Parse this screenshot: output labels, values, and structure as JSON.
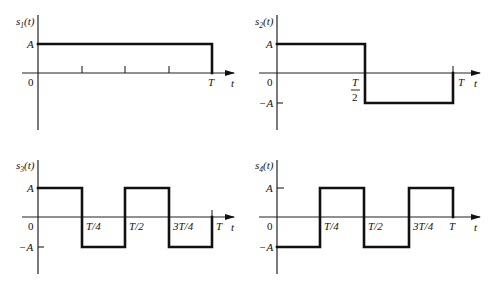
{
  "figure": {
    "axis_variable": "t",
    "zero_label": "0",
    "amplitude_label": "A",
    "neg_amplitude_label": "−A"
  },
  "panels": [
    {
      "id": "s1",
      "ylabel_main": "s",
      "ylabel_sub": "1",
      "ylabel_arg": "(t)",
      "y_ticks": [
        "A",
        "0"
      ],
      "x_tick_labels": [
        "T"
      ],
      "unlabeled_ticks": [
        "T/4",
        "T/2",
        "3T/4"
      ],
      "segments": [
        {
          "from": "0",
          "to": "T",
          "level": "A"
        }
      ]
    },
    {
      "id": "s2",
      "ylabel_main": "s",
      "ylabel_sub": "2",
      "ylabel_arg": "(t)",
      "y_ticks": [
        "A",
        "0",
        "−A"
      ],
      "x_tick_labels": [
        "T/2",
        "T"
      ],
      "half_num": "T",
      "half_den": "2",
      "segments": [
        {
          "from": "0",
          "to": "T/2",
          "level": "A"
        },
        {
          "from": "T/2",
          "to": "T",
          "level": "−A"
        }
      ]
    },
    {
      "id": "s3",
      "ylabel_main": "s",
      "ylabel_sub": "3",
      "ylabel_arg": "(t)",
      "y_ticks": [
        "A",
        "0",
        "−A"
      ],
      "x_tick_labels": [
        "T/4",
        "T/2",
        "3T/4",
        "T"
      ],
      "segments": [
        {
          "from": "0",
          "to": "T/4",
          "level": "A"
        },
        {
          "from": "T/4",
          "to": "T/2",
          "level": "−A"
        },
        {
          "from": "T/2",
          "to": "3T/4",
          "level": "A"
        },
        {
          "from": "3T/4",
          "to": "T",
          "level": "−A"
        }
      ]
    },
    {
      "id": "s4",
      "ylabel_main": "s",
      "ylabel_sub": "4",
      "ylabel_arg": "(t)",
      "y_ticks": [
        "A",
        "0",
        "−A"
      ],
      "x_tick_labels": [
        "T/4",
        "T/2",
        "3T/4",
        "T"
      ],
      "segments": [
        {
          "from": "0",
          "to": "T/4",
          "level": "−A"
        },
        {
          "from": "T/4",
          "to": "T/2",
          "level": "A"
        },
        {
          "from": "T/2",
          "to": "3T/4",
          "level": "−A"
        },
        {
          "from": "3T/4",
          "to": "T",
          "level": "A"
        }
      ]
    }
  ]
}
